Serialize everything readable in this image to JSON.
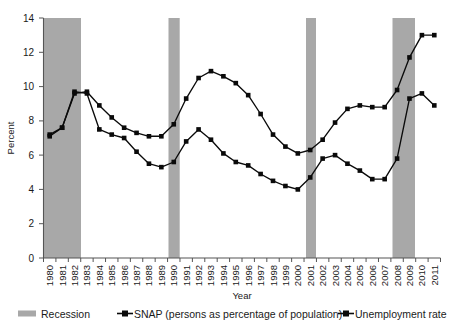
{
  "chart_data": {
    "type": "line",
    "title": "",
    "xlabel": "Year",
    "ylabel": "Percent",
    "ylim": [
      0,
      14
    ],
    "yticks": [
      0,
      2,
      4,
      6,
      8,
      10,
      12,
      14
    ],
    "grid": false,
    "legend_position": "bottom",
    "categories": [
      "1980",
      "1981",
      "1982",
      "1983",
      "1984",
      "1985",
      "1986",
      "1987",
      "1988",
      "1989",
      "1990",
      "1991",
      "1992",
      "1993",
      "1994",
      "1995",
      "1996",
      "1997",
      "1998",
      "1999",
      "2000",
      "2001",
      "2002",
      "2003",
      "2004",
      "2005",
      "2006",
      "2007",
      "2008",
      "2009",
      "2010",
      "2011"
    ],
    "series": [
      {
        "name": "SNAP (persons as percentage of population)",
        "values": [
          7.2,
          7.6,
          9.6,
          9.7,
          8.9,
          8.2,
          7.6,
          7.3,
          7.1,
          7.1,
          7.8,
          9.3,
          10.5,
          10.9,
          10.6,
          10.2,
          9.5,
          8.4,
          7.2,
          6.5,
          6.1,
          6.3,
          6.9,
          7.9,
          8.7,
          8.9,
          8.8,
          8.8,
          9.8,
          11.7,
          13.0,
          13.0
        ],
        "marker": "filled-square"
      },
      {
        "name": "Unemployment rate",
        "values": [
          7.1,
          7.6,
          9.7,
          9.6,
          7.5,
          7.2,
          7.0,
          6.2,
          5.5,
          5.3,
          5.6,
          6.8,
          7.5,
          6.9,
          6.1,
          5.6,
          5.4,
          4.9,
          4.5,
          4.2,
          4.0,
          4.7,
          5.8,
          6.0,
          5.5,
          5.1,
          4.6,
          4.6,
          5.8,
          9.3,
          9.6,
          8.9
        ],
        "marker": "filled-square"
      }
    ],
    "shaded_regions": [
      {
        "label": "Recession",
        "start": "1980",
        "end": "1982.8"
      },
      {
        "label": "Recession",
        "start": "1990.4",
        "end": "1991.3"
      },
      {
        "label": "Recession",
        "start": "2001.0",
        "end": "2001.8"
      },
      {
        "label": "Recession",
        "start": "2007.7",
        "end": "2009.5"
      }
    ],
    "colors": {
      "line": "#0a0a0a",
      "recession_band": "#a8a8a8",
      "axis": "#555555",
      "background": "#ffffff"
    }
  },
  "axis": {
    "y_title": "Percent",
    "x_title": "Year",
    "y_tick_labels": [
      "14",
      "12",
      "10",
      "8",
      "6",
      "4",
      "2",
      "0"
    ],
    "x_tick_labels": [
      "1980",
      "1981",
      "1982",
      "1983",
      "1984",
      "1985",
      "1986",
      "1987",
      "1988",
      "1989",
      "1990",
      "1991",
      "1992",
      "1993",
      "1994",
      "1995",
      "1996",
      "1997",
      "1998",
      "1999",
      "2000",
      "2001",
      "2002",
      "2003",
      "2004",
      "2005",
      "2006",
      "2007",
      "2008",
      "2009",
      "2010",
      "2011"
    ]
  },
  "legend": {
    "items": [
      {
        "label": "Recession",
        "marker": "recession-swatch"
      },
      {
        "label": "SNAP (persons as percentage of population)",
        "marker": "line-square-marker"
      },
      {
        "label": "Unemployment rate",
        "marker": "line-square-marker"
      }
    ]
  }
}
